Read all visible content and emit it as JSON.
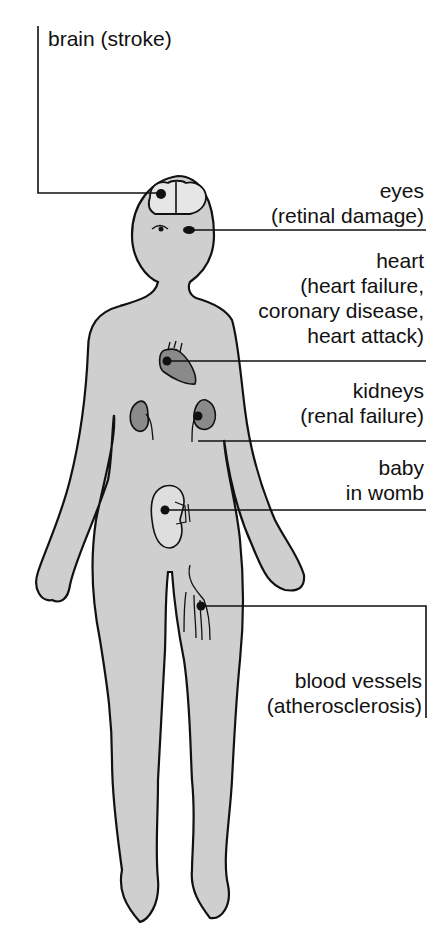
{
  "colors": {
    "body_fill": "#cfcfcf",
    "organ_fill": "#8a8a8a",
    "brain_fill": "#e6e6e6",
    "line": "#111111"
  },
  "labels": {
    "brain": {
      "line1": "brain (stroke)"
    },
    "eyes": {
      "line1": "eyes",
      "line2": "(retinal damage)"
    },
    "heart": {
      "line1": "heart",
      "line2": "(heart failure,",
      "line3": "coronary disease,",
      "line4": "heart attack)"
    },
    "kidneys": {
      "line1": "kidneys",
      "line2": "(renal failure)"
    },
    "baby": {
      "line1": "baby",
      "line2": "in womb"
    },
    "vessels": {
      "line1": "blood vessels",
      "line2": "(atherosclerosis)"
    }
  }
}
